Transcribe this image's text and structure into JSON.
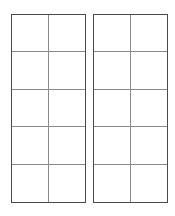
{
  "figure": {
    "title": "",
    "background_color": "#ffffff",
    "width": 175,
    "height": 216
  },
  "style": {
    "outer_border_color": "#4a4a4a",
    "inner_line_color": "#8a8a8a",
    "cell_fill_color": "#ffffff",
    "outer_border_width_px": 1,
    "inner_line_width_px": 1
  },
  "layout": {
    "panel_count": 2,
    "panel_gap_px": 7,
    "rows": 5,
    "columns": 2,
    "cells_per_panel": 10,
    "total_cells": 20
  },
  "panels": [
    {
      "name": "left-grid",
      "x": 11,
      "y": 14,
      "width": 75,
      "height": 189,
      "rows": [
        {
          "cells": [
            "",
            ""
          ]
        },
        {
          "cells": [
            "",
            ""
          ]
        },
        {
          "cells": [
            "",
            ""
          ]
        },
        {
          "cells": [
            "",
            ""
          ]
        },
        {
          "cells": [
            "",
            ""
          ]
        }
      ]
    },
    {
      "name": "right-grid",
      "x": 93,
      "y": 14,
      "width": 75,
      "height": 189,
      "rows": [
        {
          "cells": [
            "",
            ""
          ]
        },
        {
          "cells": [
            "",
            ""
          ]
        },
        {
          "cells": [
            "",
            ""
          ]
        },
        {
          "cells": [
            "",
            ""
          ]
        },
        {
          "cells": [
            "",
            ""
          ]
        }
      ]
    }
  ]
}
